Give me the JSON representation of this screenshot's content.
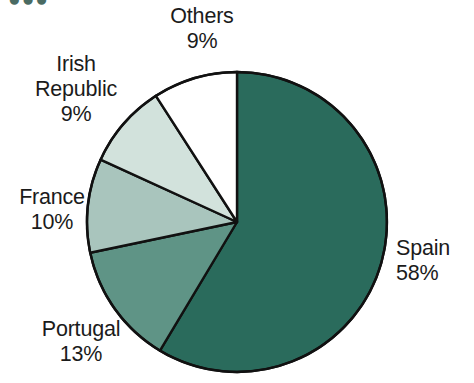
{
  "figure": {
    "title_remnant": "●●●",
    "background_color": "#ffffff"
  },
  "chart_data": {
    "type": "pie",
    "title": "",
    "subtitle": "",
    "xlabel": "",
    "ylabel": "",
    "grid": false,
    "legend_position": "none",
    "labels_position": "outside",
    "start_angle_deg": 0,
    "direction": "clockwise",
    "center_px": [
      237,
      222
    ],
    "radius_px": 150,
    "categories": [
      "Spain",
      "Portugal",
      "France",
      "Irish Republic",
      "Others"
    ],
    "values": [
      58,
      13,
      10,
      9,
      9
    ],
    "value_unit": "%",
    "colors": [
      "#2a6b5c",
      "#5f9486",
      "#a9c5bd",
      "#d2e2dc",
      "#ffffff"
    ],
    "slice_edge_color": "#111111",
    "slices": [
      {
        "name": "Spain",
        "value": 58,
        "label": "Spain",
        "percent_label": "58%",
        "color": "#2a6b5c",
        "start_deg": 0,
        "end_deg": 208.8
      },
      {
        "name": "Portugal",
        "value": 13,
        "label": "Portugal",
        "percent_label": "13%",
        "color": "#5f9486",
        "start_deg": 208.8,
        "end_deg": 255.6
      },
      {
        "name": "France",
        "value": 10,
        "label": "France",
        "percent_label": "10%",
        "color": "#a9c5bd",
        "start_deg": 255.6,
        "end_deg": 291.6
      },
      {
        "name": "Irish Republic",
        "value": 9,
        "label": "Irish Republic",
        "percent_label": "9%",
        "color": "#d2e2dc",
        "start_deg": 291.6,
        "end_deg": 324.0
      },
      {
        "name": "Others",
        "value": 9,
        "label": "Others",
        "percent_label": "9%",
        "color": "#ffffff",
        "start_deg": 324.0,
        "end_deg": 360.0
      }
    ]
  },
  "labels": {
    "others": {
      "name": "Others",
      "percent": "9%"
    },
    "irish": {
      "line1": "Irish",
      "line2": "Republic",
      "percent": "9%"
    },
    "france": {
      "name": "France",
      "percent": "10%"
    },
    "portugal": {
      "name": "Portugal",
      "percent": "13%"
    },
    "spain": {
      "name": "Spain",
      "percent": "58%"
    }
  }
}
